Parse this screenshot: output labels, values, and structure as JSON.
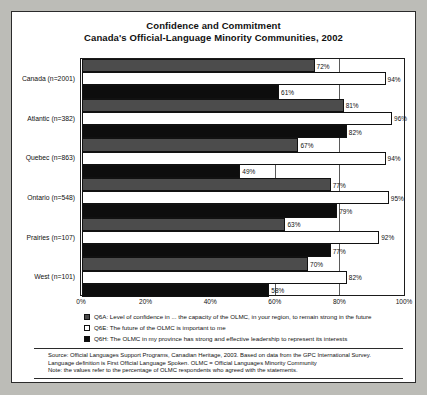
{
  "title": {
    "line1": "Confidence and Commitment",
    "line2": "Canada's Official-Language Minority Communities, 2002"
  },
  "legend": [
    {
      "key": "Q6A",
      "swatch": "dark-gray",
      "text": "Q6A: Level of confidence in ... the capacity of the OLMC, in your region, to remain strong in the future"
    },
    {
      "key": "Q6E",
      "swatch": "white",
      "text": "Q6E:  The future of the OLMC is important to me"
    },
    {
      "key": "Q6H",
      "swatch": "black",
      "text": "Q6H: The OLMC in my province has strong and effective leadership to represent its interests"
    }
  ],
  "footnote": {
    "line1": "Source:  Official Languages Support Programs, Canadian Heritage, 2003.  Based on data from the GPC International Survey.",
    "line2": "Language definition is First Official Language Spoken.  OLMC = Official Languages Minority Community",
    "line3": "Note:  the values refer to the percentage of OLMC respondents who agreed with the statements."
  },
  "chart_data": {
    "type": "bar",
    "orientation": "horizontal",
    "xlabel": "",
    "ylabel": "",
    "xlim": [
      0,
      100
    ],
    "xticks": [
      "0%",
      "20%",
      "40%",
      "60%",
      "80%",
      "100%"
    ],
    "xtick_values": [
      0,
      20,
      40,
      60,
      80,
      100
    ],
    "grid": true,
    "legend_position": "below",
    "categories": [
      "Canada (n=2001)",
      "Atlantic (n=382)",
      "Quebec (n=863)",
      "Ontario (n=548)",
      "Prairies (n=107)",
      "West (n=101)"
    ],
    "series": [
      {
        "name": "Q6A",
        "color": "#4c4c4c",
        "values": [
          72,
          81,
          67,
          77,
          63,
          70
        ],
        "labels": [
          "72%",
          "81%",
          "67%",
          "77%",
          "63%",
          "70%"
        ]
      },
      {
        "name": "Q6E",
        "color": "#ffffff",
        "values": [
          94,
          96,
          94,
          95,
          92,
          82
        ],
        "labels": [
          "94%",
          "96%",
          "94%",
          "95%",
          "92%",
          "82%"
        ]
      },
      {
        "name": "Q6H",
        "color": "#0d0d0d",
        "values": [
          61,
          82,
          49,
          79,
          77,
          58
        ],
        "labels": [
          "61%",
          "82%",
          "49%",
          "79%",
          "77%",
          "58%"
        ]
      }
    ]
  }
}
